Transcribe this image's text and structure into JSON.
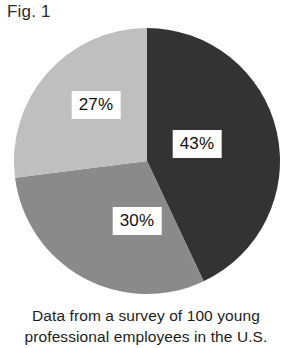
{
  "figure": {
    "title": "Fig. 1",
    "caption_lines": [
      "Data from a survey of 100 young",
      "professional employees in the U.S."
    ]
  },
  "chart_data": {
    "type": "pie",
    "title": "Fig. 1",
    "subtitle": "Data from a survey of 100 young professional employees in the U.S.",
    "categories": [
      "43%",
      "30%",
      "27%"
    ],
    "values": [
      43,
      30,
      27
    ],
    "unit": "percent",
    "total": 100,
    "start_angle_deg": 0,
    "direction": "clockwise",
    "legend": "none",
    "grid": false,
    "slices": [
      {
        "label": "43%",
        "value": 43,
        "color": "#333333",
        "start_deg": 0,
        "end_deg": 154.8,
        "label_text_color": "#111111",
        "label_box_color": "#ffffff"
      },
      {
        "label": "30%",
        "value": 30,
        "color": "#8a8a8a",
        "start_deg": 154.8,
        "end_deg": 262.8,
        "label_text_color": "#111111",
        "label_box_color": "#ffffff"
      },
      {
        "label": "27%",
        "value": 27,
        "color": "#bfbfbf",
        "start_deg": 262.8,
        "end_deg": 360,
        "label_text_color": "#111111",
        "label_box_color": "#ffffff"
      }
    ],
    "background_color": "#ffffff"
  }
}
